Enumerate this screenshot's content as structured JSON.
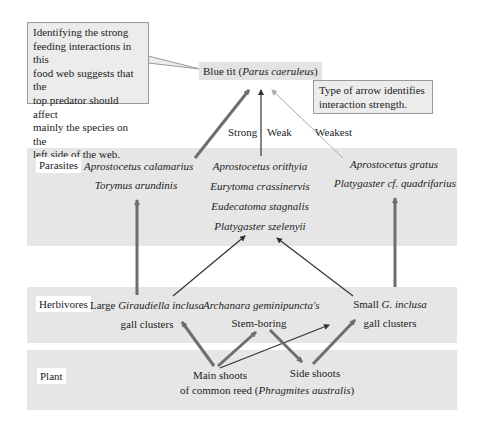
{
  "top_predator": {
    "name": "Blue tit",
    "latin": "Parus caeruleus"
  },
  "callouts": {
    "strong_interactions": [
      "Identifying the strong",
      "feeding interactions in this",
      "food web suggests that the",
      "top predator should affect",
      "mainly the species on the",
      "left side of the web."
    ],
    "arrow_legend": [
      "Type of arrow identifies",
      "interaction strength."
    ]
  },
  "strength_labels": {
    "strong": "Strong",
    "weak": "Weak",
    "weakest": "Weakest"
  },
  "levels": {
    "parasites": {
      "label": "Parasites",
      "left": [
        "Aprostocetus calamarius",
        "Torymus arundinis"
      ],
      "center": [
        "Aprostocetus orithyia",
        "Eurytoma crassinervis",
        "Eudecatoma stagnalis",
        "Platygaster szelenyii"
      ],
      "right": [
        "Aprostocetus gratus",
        "Platygaster cf. quadrifarius"
      ]
    },
    "herbivores": {
      "label": "Herbivores",
      "left": {
        "prefix": "Large ",
        "species": "Giraudiella inclusa",
        "line2": "gall clusters"
      },
      "center": {
        "species": "Archanara geminipuncta's",
        "line2": "Stem-boring"
      },
      "right": {
        "prefix": "Small ",
        "species": "G. inclusa",
        "line2": "gall clusters"
      }
    },
    "plant": {
      "label": "Plant",
      "main": "Main shoots",
      "side": "Side shoots",
      "common": "of common reed (",
      "latin": "Phragmites australis",
      "close": ")"
    }
  },
  "colors": {
    "panel": "#e6e6e6",
    "arrow_strong": "#6e6e6e",
    "arrow_weak": "#333333",
    "arrow_weakest": "#aaaaaa"
  }
}
